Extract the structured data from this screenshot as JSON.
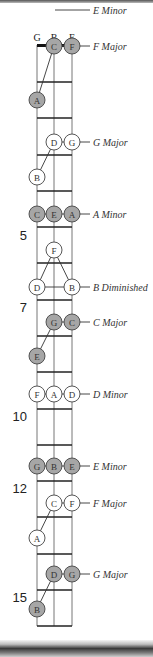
{
  "diagram": {
    "strings": [
      {
        "name": "G",
        "x": 37
      },
      {
        "name": "B",
        "x": 54
      },
      {
        "name": "E",
        "x": 72
      }
    ],
    "nut_y": 45,
    "frets_y": [
      82,
      118,
      155,
      191,
      227,
      263,
      300,
      336,
      372,
      409,
      445,
      481,
      517,
      554,
      590,
      626
    ],
    "fret_numbers": [
      {
        "label": "5",
        "y": 240
      },
      {
        "label": "7",
        "y": 312
      },
      {
        "label": "10",
        "y": 421
      },
      {
        "label": "12",
        "y": 493
      },
      {
        "label": "15",
        "y": 602
      }
    ],
    "colors": {
      "shaded_fill": "#a6a6a6",
      "open_fill": "#ffffff",
      "line": "#333333"
    },
    "chords": [
      {
        "name": "E Minor",
        "label_y": 10,
        "line_y": 10,
        "notes": [],
        "open_shape": true
      },
      {
        "name": "F Major",
        "label_y": 46,
        "line_y": 46,
        "shaded": true,
        "notes": [
          {
            "string": 1,
            "note": "C",
            "y": 46
          },
          {
            "string": 2,
            "note": "F",
            "y": 46
          },
          {
            "string": 0,
            "note": "A",
            "y": 100
          }
        ],
        "connector": [
          [
            1,
            46,
            0,
            100
          ]
        ]
      },
      {
        "name": "G Major",
        "label_y": 142,
        "line_y": 142,
        "shaded": false,
        "notes": [
          {
            "string": 1,
            "note": "D",
            "y": 142
          },
          {
            "string": 2,
            "note": "G",
            "y": 142
          },
          {
            "string": 0,
            "note": "B",
            "y": 177
          }
        ],
        "connector": [
          [
            1,
            142,
            0,
            177
          ]
        ]
      },
      {
        "name": "A Minor",
        "label_y": 214,
        "line_y": 214,
        "shaded": true,
        "notes": [
          {
            "string": 0,
            "note": "C",
            "y": 214
          },
          {
            "string": 1,
            "note": "E",
            "y": 214
          },
          {
            "string": 2,
            "note": "A",
            "y": 214
          }
        ],
        "connector": []
      },
      {
        "name": "B Diminished",
        "label_y": 287,
        "line_y": 287,
        "shaded": false,
        "notes": [
          {
            "string": 1,
            "note": "F",
            "y": 250
          },
          {
            "string": 0,
            "note": "D",
            "y": 287
          },
          {
            "string": 2,
            "note": "B",
            "y": 287
          }
        ],
        "connector": [
          [
            1,
            250,
            0,
            287
          ],
          [
            1,
            250,
            2,
            287
          ]
        ]
      },
      {
        "name": "C Major",
        "label_y": 322,
        "line_y": 322,
        "shaded": true,
        "notes": [
          {
            "string": 1,
            "note": "G",
            "y": 322
          },
          {
            "string": 2,
            "note": "C",
            "y": 322
          },
          {
            "string": 0,
            "note": "E",
            "y": 356
          }
        ],
        "connector": [
          [
            1,
            322,
            0,
            356
          ]
        ]
      },
      {
        "name": "D Minor",
        "label_y": 394,
        "line_y": 394,
        "shaded": false,
        "notes": [
          {
            "string": 0,
            "note": "F",
            "y": 394
          },
          {
            "string": 1,
            "note": "A",
            "y": 394
          },
          {
            "string": 2,
            "note": "D",
            "y": 394
          }
        ],
        "connector": []
      },
      {
        "name": "E Minor",
        "label_y": 466,
        "line_y": 466,
        "shaded": true,
        "notes": [
          {
            "string": 0,
            "note": "G",
            "y": 466
          },
          {
            "string": 1,
            "note": "B",
            "y": 466
          },
          {
            "string": 2,
            "note": "E",
            "y": 466
          }
        ],
        "connector": []
      },
      {
        "name": "F Major",
        "label_y": 503,
        "line_y": 503,
        "shaded": false,
        "notes": [
          {
            "string": 1,
            "note": "C",
            "y": 503
          },
          {
            "string": 2,
            "note": "F",
            "y": 503
          },
          {
            "string": 0,
            "note": "A",
            "y": 538
          }
        ],
        "connector": [
          [
            1,
            503,
            0,
            538
          ]
        ]
      },
      {
        "name": "G Major",
        "label_y": 574,
        "line_y": 574,
        "shaded": true,
        "notes": [
          {
            "string": 1,
            "note": "D",
            "y": 574
          },
          {
            "string": 2,
            "note": "G",
            "y": 574
          },
          {
            "string": 0,
            "note": "B",
            "y": 609
          }
        ],
        "connector": [
          [
            1,
            574,
            0,
            609
          ]
        ]
      }
    ]
  }
}
